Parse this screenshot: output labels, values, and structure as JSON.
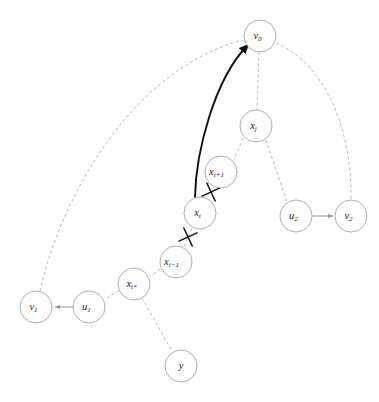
{
  "figure": {
    "width": 379,
    "height": 402,
    "background_color": "#ffffff",
    "top_clipped_text": "",
    "caption_clipped_text": ""
  },
  "style": {
    "node_fill": "#ffffff",
    "node_stroke": "#9a9a9a",
    "dashed_edge_color": "#a8a8a8",
    "solid_edge_color": "#8f8f8f",
    "bold_edge_color": "#111111",
    "cut_mark_color": "#111111",
    "label_color": "#1a1a1a",
    "node_radius": 16
  },
  "nodes": [
    {
      "id": "v0",
      "base": "v",
      "sub": "0",
      "cx": 260,
      "cy": 36,
      "r": 16
    },
    {
      "id": "xj",
      "base": "x",
      "sub": "j",
      "cx": 256,
      "cy": 126,
      "r": 16
    },
    {
      "id": "xi1",
      "base": "x",
      "sub": "i+1",
      "cx": 221,
      "cy": 172,
      "r": 16
    },
    {
      "id": "xi",
      "base": "x",
      "sub": "i",
      "cx": 200,
      "cy": 213,
      "r": 16
    },
    {
      "id": "xim1",
      "base": "x",
      "sub": "i−1",
      "cx": 176,
      "cy": 262,
      "r": 16
    },
    {
      "id": "xtstar",
      "base": "x",
      "sub": "t*",
      "cx": 134,
      "cy": 284,
      "r": 16
    },
    {
      "id": "u1",
      "base": "u",
      "sub": "1",
      "cx": 89,
      "cy": 307,
      "r": 16
    },
    {
      "id": "v1",
      "base": "v",
      "sub": "1",
      "cx": 36,
      "cy": 307,
      "r": 16
    },
    {
      "id": "y",
      "base": "y",
      "sub": "",
      "cx": 181,
      "cy": 366,
      "r": 16
    },
    {
      "id": "u2",
      "base": "u",
      "sub": "2",
      "cx": 296,
      "cy": 216,
      "r": 16
    },
    {
      "id": "v2",
      "base": "v",
      "sub": "2",
      "cx": 351,
      "cy": 216,
      "r": 16
    }
  ],
  "edges": [
    {
      "id": "e-v1-v0",
      "from": "v1",
      "to": "v0",
      "style": "dashed",
      "kind": "curve",
      "path": "M 40 291 C 60 200 130 70 243 40"
    },
    {
      "id": "e-v0-xj",
      "from": "v0",
      "to": "xj",
      "style": "dashed",
      "kind": "line",
      "path": "M 259 52 L 257 110"
    },
    {
      "id": "e-v0-v2",
      "from": "v0",
      "to": "v2",
      "style": "dashed",
      "kind": "curve",
      "path": "M 276 43 C 320 62 352 120 351 200"
    },
    {
      "id": "e-xj-xi1",
      "from": "xj",
      "to": "xi1",
      "style": "dashed",
      "kind": "line",
      "path": "M 243 138 L 234 160"
    },
    {
      "id": "e-xj-u2",
      "from": "xj",
      "to": "u2",
      "style": "dashed",
      "kind": "line",
      "path": "M 266 140 L 287 202"
    },
    {
      "id": "e-xi1-xi",
      "from": "xi1",
      "to": "xi",
      "style": "dashed",
      "kind": "line",
      "path": "M 209 183 L 212 180"
    },
    {
      "id": "e-xi1-xi-b",
      "from": "xi1",
      "to": "xi",
      "style": "dashed",
      "kind": "line",
      "path": "M 208 184 L 214 178"
    },
    {
      "id": "e-xi-xim1",
      "from": "xi",
      "to": "xim1",
      "style": "dashed",
      "kind": "line",
      "path": "M 192 228 L 184 247"
    },
    {
      "id": "e-xim1-xt",
      "from": "xim1",
      "to": "xtstar",
      "style": "dashed",
      "kind": "line",
      "path": "M 160 269 L 150 277"
    },
    {
      "id": "e-xt-u1",
      "from": "xtstar",
      "to": "u1",
      "style": "dashed",
      "kind": "line",
      "path": "M 119 291 L 105 299"
    },
    {
      "id": "e-xt-y",
      "from": "xtstar",
      "to": "y",
      "style": "dashed",
      "kind": "line",
      "path": "M 142 298 L 172 351"
    },
    {
      "id": "e-u1-v1",
      "from": "u1",
      "to": "v1",
      "style": "solid",
      "kind": "arrow",
      "path": "M 73 307 L 55 307"
    },
    {
      "id": "e-u2-v2",
      "from": "u2",
      "to": "v2",
      "style": "solid",
      "kind": "arrow",
      "path": "M 312 216 L 333 216"
    },
    {
      "id": "e-xi-v0",
      "from": "xi",
      "to": "v0",
      "style": "bold",
      "kind": "arrow",
      "path": "M 195 197 C 196 150 215 80 246 47"
    }
  ],
  "cut_marks": [
    {
      "id": "cut-xi-xi1",
      "on_edge": "e-xi1-xi",
      "cx": 211,
      "cy": 192,
      "size": 7,
      "rotation": 20
    },
    {
      "id": "cut-xi-xim1",
      "on_edge": "e-xi-xim1",
      "cx": 188,
      "cy": 237,
      "size": 7,
      "rotation": 20
    }
  ],
  "arrowheads": [
    {
      "id": "arrow-into-v0",
      "target": "v0",
      "color": "#111111"
    },
    {
      "id": "arrow-into-v1",
      "target": "v1",
      "color": "#8f8f8f"
    },
    {
      "id": "arrow-into-v2",
      "target": "v2",
      "color": "#8f8f8f"
    }
  ]
}
